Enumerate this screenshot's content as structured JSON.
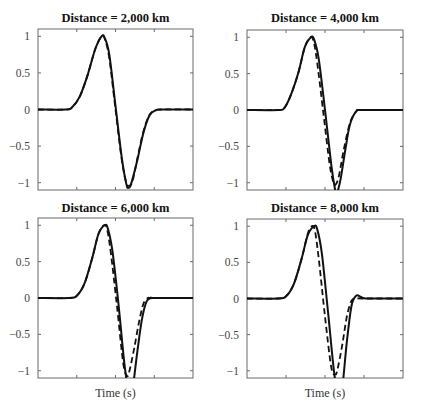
{
  "chart_data": [
    {
      "type": "line",
      "title": "Distance = 2,000 km",
      "xlabel": "",
      "ylabel": "",
      "ylim": [
        -1.1,
        1.1
      ],
      "yticks": [
        -1,
        -0.5,
        0,
        0.5,
        1
      ],
      "ytick_labels": [
        "−1",
        "−0.5",
        "0",
        "0.5",
        "1"
      ],
      "xticks_labeled": false,
      "grid": false,
      "legend": null,
      "series": [
        {
          "name": "solid",
          "style": "solid",
          "x": [
            0,
            0.18,
            0.22,
            0.27,
            0.32,
            0.37,
            0.41,
            0.43,
            0.46,
            0.5,
            0.54,
            0.57,
            0.585,
            0.6,
            0.64,
            0.68,
            0.72,
            0.76,
            0.8,
            1
          ],
          "y": [
            0,
            0,
            0.03,
            0.18,
            0.47,
            0.83,
            1.0,
            0.98,
            0.75,
            0.05,
            -0.65,
            -1.02,
            -1.07,
            -1.02,
            -0.7,
            -0.32,
            -0.08,
            -0.01,
            0,
            0
          ]
        },
        {
          "name": "dashed",
          "style": "dashed",
          "x": [
            0,
            0.18,
            0.22,
            0.27,
            0.32,
            0.37,
            0.41,
            0.43,
            0.46,
            0.5,
            0.54,
            0.57,
            0.59,
            0.61,
            0.64,
            0.68,
            0.72,
            0.76,
            0.8,
            1
          ],
          "y": [
            0,
            0,
            0.03,
            0.18,
            0.47,
            0.83,
            1.0,
            0.97,
            0.7,
            0.0,
            -0.68,
            -1.0,
            -1.04,
            -0.98,
            -0.68,
            -0.3,
            -0.07,
            -0.01,
            0,
            0
          ]
        }
      ]
    },
    {
      "type": "line",
      "title": "Distance = 4,000 km",
      "xlabel": "",
      "ylabel": "",
      "ylim": [
        -1.1,
        1.1
      ],
      "yticks": [
        -1,
        -0.5,
        0,
        0.5,
        1
      ],
      "ytick_labels": [
        "−1",
        "−0.5",
        "0",
        "0.5",
        "1"
      ],
      "xticks_labeled": false,
      "grid": false,
      "legend": null,
      "series": [
        {
          "name": "solid",
          "style": "solid",
          "x": [
            0,
            0.2,
            0.24,
            0.28,
            0.33,
            0.37,
            0.41,
            0.43,
            0.46,
            0.5,
            0.54,
            0.565,
            0.575,
            0.6,
            0.63,
            0.66,
            0.7,
            0.74,
            1
          ],
          "y": [
            0,
            0,
            0.03,
            0.2,
            0.52,
            0.86,
            1.0,
            0.97,
            0.7,
            0.0,
            -0.75,
            -1.1,
            -1.15,
            -0.95,
            -0.55,
            -0.2,
            -0.02,
            0,
            0
          ]
        },
        {
          "name": "dashed",
          "style": "dashed",
          "x": [
            0,
            0.2,
            0.24,
            0.28,
            0.33,
            0.37,
            0.405,
            0.425,
            0.45,
            0.49,
            0.53,
            0.555,
            0.57,
            0.59,
            0.62,
            0.66,
            0.7,
            0.74,
            1
          ],
          "y": [
            0,
            0,
            0.03,
            0.2,
            0.52,
            0.86,
            1.0,
            0.96,
            0.65,
            -0.05,
            -0.75,
            -1.0,
            -1.02,
            -0.9,
            -0.55,
            -0.18,
            -0.02,
            0,
            0
          ]
        }
      ]
    },
    {
      "type": "line",
      "title": "Distance = 6,000 km",
      "xlabel": "Time (s)",
      "ylabel": "",
      "ylim": [
        -1.1,
        1.1
      ],
      "yticks": [
        -1,
        -0.5,
        0,
        0.5,
        1
      ],
      "ytick_labels": [
        "−1",
        "−0.5",
        "0",
        "0.5",
        "1"
      ],
      "xticks_labeled": false,
      "grid": false,
      "legend": null,
      "series": [
        {
          "name": "solid",
          "style": "solid",
          "x": [
            0,
            0.2,
            0.25,
            0.3,
            0.35,
            0.39,
            0.43,
            0.45,
            0.48,
            0.52,
            0.56,
            0.59,
            0.61,
            0.64,
            0.67,
            0.7,
            0.73,
            0.75,
            1
          ],
          "y": [
            0,
            0,
            0.03,
            0.2,
            0.55,
            0.88,
            1.0,
            0.96,
            0.65,
            -0.1,
            -0.95,
            -1.3,
            -1.25,
            -0.75,
            -0.3,
            -0.05,
            0.0,
            0,
            0
          ]
        },
        {
          "name": "dashed",
          "style": "dashed",
          "x": [
            0,
            0.2,
            0.25,
            0.3,
            0.35,
            0.39,
            0.425,
            0.445,
            0.47,
            0.51,
            0.55,
            0.575,
            0.59,
            0.62,
            0.65,
            0.68,
            0.71,
            0.74,
            1
          ],
          "y": [
            0,
            0,
            0.03,
            0.2,
            0.55,
            0.88,
            1.0,
            0.95,
            0.62,
            -0.12,
            -0.9,
            -1.07,
            -1.0,
            -0.7,
            -0.35,
            -0.08,
            0.0,
            0,
            0
          ]
        }
      ]
    },
    {
      "type": "line",
      "title": "Distance = 8,000 km",
      "xlabel": "Time (s)",
      "ylabel": "",
      "ylim": [
        -1.1,
        1.1
      ],
      "yticks": [
        -1,
        -0.5,
        0,
        0.5,
        1
      ],
      "ytick_labels": [
        "−1",
        "−0.5",
        "0",
        "0.5",
        "1"
      ],
      "xticks_labeled": false,
      "grid": false,
      "legend": null,
      "series": [
        {
          "name": "solid",
          "style": "solid",
          "x": [
            0,
            0.2,
            0.25,
            0.3,
            0.35,
            0.39,
            0.43,
            0.45,
            0.48,
            0.52,
            0.56,
            0.59,
            0.61,
            0.64,
            0.67,
            0.7,
            0.73,
            0.76,
            0.8,
            1
          ],
          "y": [
            0,
            0,
            0.03,
            0.2,
            0.55,
            0.88,
            1.0,
            0.96,
            0.62,
            -0.2,
            -1.05,
            -1.35,
            -1.25,
            -0.6,
            -0.1,
            0.04,
            0.02,
            0,
            0,
            0
          ]
        },
        {
          "name": "dashed",
          "style": "dashed",
          "x": [
            0,
            0.2,
            0.25,
            0.3,
            0.35,
            0.39,
            0.415,
            0.435,
            0.46,
            0.5,
            0.54,
            0.565,
            0.58,
            0.61,
            0.64,
            0.67,
            0.7,
            0.74,
            1
          ],
          "y": [
            0,
            0,
            0.03,
            0.2,
            0.55,
            0.9,
            1.0,
            0.94,
            0.55,
            -0.25,
            -0.95,
            -1.05,
            -0.98,
            -0.65,
            -0.25,
            -0.03,
            0.0,
            0,
            0
          ]
        }
      ]
    }
  ],
  "panels": [
    {
      "title": "Distance = 2,000 km",
      "xlabel": ""
    },
    {
      "title": "Distance = 4,000 km",
      "xlabel": ""
    },
    {
      "title": "Distance = 6,000 km",
      "xlabel": "Time (s)"
    },
    {
      "title": "Distance = 8,000 km",
      "xlabel": "Time (s)"
    }
  ],
  "colors": {
    "line": "#111111",
    "frame": "#6a6a6a",
    "tick_text": "#444444"
  }
}
